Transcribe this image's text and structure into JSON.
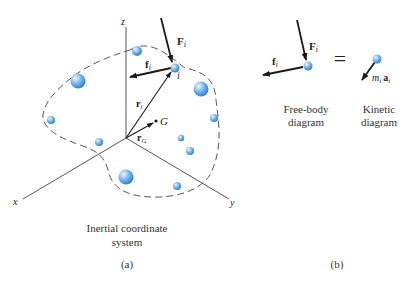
{
  "figure_a": {
    "axes": {
      "z_label": "z",
      "x_label": "x",
      "y_label": "y"
    },
    "labels": {
      "F_i": "F",
      "F_i_sub": "i",
      "f_i": "f",
      "f_i_sub": "i",
      "particle_i": "i",
      "r_i": "r",
      "r_i_sub": "i",
      "r_G": "r",
      "r_G_sub": "G",
      "G": "G"
    },
    "caption_line1": "Inertial coordinate",
    "caption_line2": "system",
    "panel_label": "(a)"
  },
  "figure_b": {
    "free_body": {
      "F_i": "F",
      "F_i_sub": "i",
      "f_i": "f",
      "f_i_sub": "i",
      "caption_line1": "Free-body",
      "caption_line2": "diagram"
    },
    "equals": "=",
    "kinetic": {
      "m": "m",
      "m_sub": "i",
      "a": "a",
      "a_sub": "i",
      "caption_line1": "Kinetic",
      "caption_line2": "diagram"
    },
    "panel_label": "(b)"
  },
  "colors": {
    "sphere_light": "#d6ecff",
    "sphere_mid": "#6fb0ef",
    "sphere_dark": "#2f78c8",
    "axis": "#555555",
    "arrow": "#1a1a1a",
    "dash": "#444444"
  }
}
